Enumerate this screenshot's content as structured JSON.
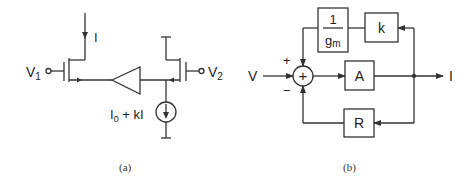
{
  "figure_a": {
    "caption": "(a)",
    "labels": {
      "current_in": "I",
      "v1": "V",
      "v1_sub": "1",
      "v2": "V",
      "v2_sub": "2",
      "source_main": "I",
      "source_sub": "0",
      "source_rest": " + kI"
    }
  },
  "figure_b": {
    "caption": "(b)",
    "labels": {
      "input": "V",
      "output": "I",
      "plus": "+",
      "minus": "−",
      "sum": "+",
      "block_A": "A",
      "block_R": "R",
      "block_k": "k",
      "block_gm_num": "1",
      "block_gm_den": "g",
      "block_gm_den_sub": "m"
    }
  },
  "colors": {
    "stroke": "#333333",
    "background": "#ffffff"
  }
}
